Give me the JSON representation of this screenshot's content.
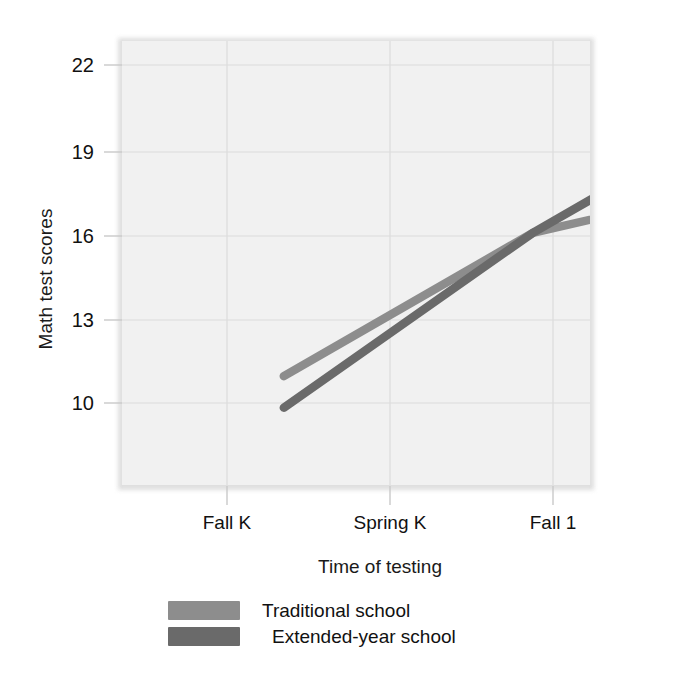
{
  "chart_data": {
    "type": "line",
    "title": "",
    "xlabel": "Time of testing",
    "ylabel": "Math test scores",
    "categories": [
      "Fall K",
      "Spring K",
      "Fall 1"
    ],
    "ytick_labels": [
      "10",
      "13",
      "16",
      "19",
      "22"
    ],
    "ytick_values": [
      10,
      13,
      16,
      19,
      22
    ],
    "ylim": [
      8.2,
      23.7
    ],
    "xlim": [
      -0.65,
      1.23
    ],
    "grid": true,
    "legend_position": "below-plot",
    "series": [
      {
        "name": "Traditional school",
        "color": "#8d8d8d",
        "values": [
          12.0,
          17.0,
          19.0
        ]
      },
      {
        "name": "Extended-year school",
        "color": "#6a6a6a",
        "values": [
          10.9,
          17.0,
          22.0
        ]
      }
    ]
  },
  "axes": {
    "y_title": "Math test scores",
    "x_title": "Time of testing",
    "y_ticks": [
      "10",
      "13",
      "16",
      "19",
      "22"
    ],
    "x_ticks": [
      "Fall K",
      "Spring K",
      "Fall 1"
    ]
  },
  "legend": {
    "items": [
      {
        "label": "Traditional school",
        "color": "#8d8d8d"
      },
      {
        "label": "Extended-year school",
        "color": "#6a6a6a"
      }
    ]
  },
  "style": {
    "plot_background": "#f1f1f1",
    "grid_color": "#dcdcdc",
    "text_color": "#111111"
  }
}
